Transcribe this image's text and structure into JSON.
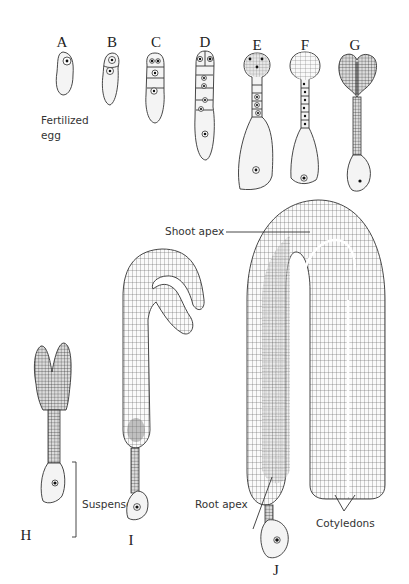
{
  "figure": {
    "stages": [
      {
        "id": "A",
        "label": "A"
      },
      {
        "id": "B",
        "label": "B"
      },
      {
        "id": "C",
        "label": "C"
      },
      {
        "id": "D",
        "label": "D"
      },
      {
        "id": "E",
        "label": "E"
      },
      {
        "id": "F",
        "label": "F"
      },
      {
        "id": "G",
        "label": "G"
      },
      {
        "id": "H",
        "label": "H"
      },
      {
        "id": "I",
        "label": "I"
      },
      {
        "id": "J",
        "label": "J"
      }
    ],
    "annotations": {
      "fertilized_egg_line1": "Fertilized",
      "fertilized_egg_line2": "egg",
      "shoot_apex": "Shoot apex",
      "suspensor": "Suspensor",
      "root_apex": "Root apex",
      "cotyledons": "Cotyledons"
    },
    "colors": {
      "ink": "#333333",
      "background": "#ffffff",
      "cell_light": "#f4f4f4"
    }
  }
}
